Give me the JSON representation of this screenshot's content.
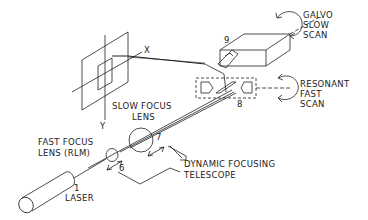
{
  "diagram": {
    "type": "laser scanning system schematic",
    "stroke_color": "#222222",
    "background": "#ffffff",
    "axis_labels": {
      "x": "X",
      "y": "Y"
    },
    "components": [
      {
        "id": "1",
        "label": "LASER"
      },
      {
        "id": "6",
        "label": "FAST FOCUS LENS (RLM)"
      },
      {
        "id": "7",
        "label": "SLOW FOCUS LENS"
      },
      {
        "id": "8",
        "label": "RESONANT FAST SCAN"
      },
      {
        "id": "9",
        "label": "GALVO SLOW SCAN"
      }
    ],
    "group_label": "DYNAMIC FOCUSING TELESCOPE"
  },
  "labels": {
    "x_axis": "X",
    "y_axis": "Y",
    "laser_num": "1",
    "laser": "LASER",
    "fast_focus_line1": "FAST FOCUS",
    "fast_focus_line2": "LENS (RLM)",
    "num6": "6",
    "slow_focus_line1": "SLOW FOCUS",
    "slow_focus_line2": "LENS",
    "num7": "7",
    "dyn_line1": "DYNAMIC FOCUSING",
    "dyn_line2": "TELESCOPE",
    "num8": "8",
    "resonant_line1": "RESONANT",
    "resonant_line2": "FAST",
    "resonant_line3": "SCAN",
    "num9": "9",
    "galvo_line1": "GALVO",
    "galvo_line2": "SLOW",
    "galvo_line3": "SCAN"
  }
}
